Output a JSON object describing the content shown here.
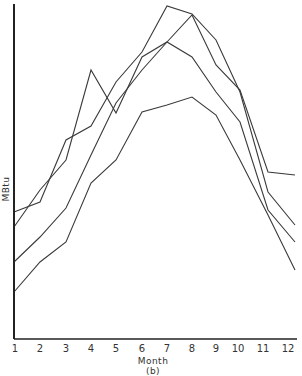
{
  "chart_data": {
    "type": "line",
    "title": "",
    "panel_label": "(b)",
    "xlabel": "Month",
    "ylabel": "MBtu",
    "categories": [
      "1",
      "2",
      "3",
      "4",
      "5",
      "6",
      "7",
      "8",
      "9",
      "10",
      "11",
      "12"
    ],
    "x": [
      1,
      2,
      3,
      4,
      5,
      6,
      7,
      8,
      9,
      10,
      11,
      12
    ],
    "y_units": "relative height (no tick labels shown)",
    "ylim": [
      0,
      339
    ],
    "grid": false,
    "legend": "none",
    "series": [
      {
        "name": "Series A",
        "values": [
          112,
          149,
          179,
          269,
          226,
          282,
          297,
          282,
          247,
          217,
          129,
          97
        ]
      },
      {
        "name": "Series B",
        "values": [
          127,
          137,
          199,
          213,
          257,
          287,
          333,
          325,
          299,
          247,
          147,
          114
        ]
      },
      {
        "name": "Series C",
        "values": [
          77,
          102,
          131,
          184,
          236,
          269,
          297,
          324,
          274,
          249,
          167,
          164
        ]
      },
      {
        "name": "Series D",
        "values": [
          47,
          77,
          97,
          156,
          179,
          227,
          234,
          242,
          224,
          179,
          124,
          69
        ]
      }
    ]
  },
  "axis": {
    "x_title": "Month",
    "panel_label": "(b)",
    "y_title": "MBtu",
    "x_ticks": [
      "1",
      "2",
      "3",
      "4",
      "5",
      "6",
      "7",
      "8",
      "9",
      "10",
      "11",
      "12"
    ]
  },
  "colors": {
    "line": "#3a3a3a",
    "axis": "#222222"
  }
}
